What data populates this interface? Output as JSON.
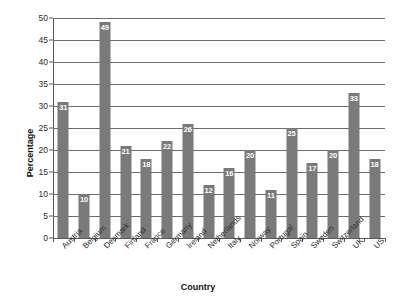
{
  "chart_data": {
    "type": "bar",
    "title": "",
    "xlabel": "Country",
    "ylabel": "Percentage",
    "ylim": [
      0,
      50
    ],
    "ytick_step": 5,
    "yticks": [
      0,
      5,
      10,
      15,
      20,
      25,
      30,
      35,
      40,
      45,
      50
    ],
    "grid": true,
    "legend": false,
    "bar_color": "#7a7a7a",
    "data_label_color": "#ffffff",
    "categories": [
      "Austria",
      "Belgium",
      "Denmark",
      "Finland",
      "France",
      "Germany",
      "Ireland",
      "Netherlands",
      "Italy",
      "Norway",
      "Portugal",
      "Spain",
      "Sweden",
      "Switzerland",
      "UK",
      "US"
    ],
    "values": [
      31,
      10,
      49,
      21,
      18,
      22,
      26,
      12,
      16,
      20,
      11,
      25,
      17,
      20,
      33,
      18
    ]
  },
  "clipped_top_text": ""
}
